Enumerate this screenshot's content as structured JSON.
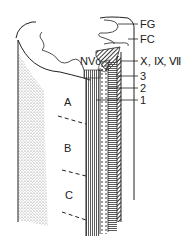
{
  "diagram": {
    "type": "anatomical cross-section schematic",
    "colors": {
      "line": "#222222",
      "background": "#ffffff",
      "stipple": "#666666"
    },
    "region_labels": {
      "nvc": "NVc",
      "a": "A",
      "b": "B",
      "c": "C"
    },
    "callouts": [
      {
        "id": "fg",
        "label": "FG"
      },
      {
        "id": "fc",
        "label": "FC"
      },
      {
        "id": "cranial",
        "label": "Ⅹ, Ⅸ, Ⅶ"
      },
      {
        "id": "three",
        "label": "3"
      },
      {
        "id": "two",
        "label": "2"
      },
      {
        "id": "one",
        "label": "1"
      }
    ]
  }
}
